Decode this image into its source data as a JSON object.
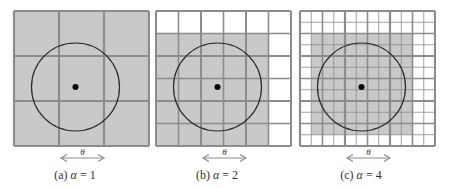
{
  "figure": {
    "colors": {
      "shaded": "#c9c9c9",
      "grid": "#8c8c8c",
      "circle": "#2a2a2a",
      "dot": "#000000",
      "arrow": "#8c8c8c",
      "text": "#333333"
    },
    "arrow_label": "θ",
    "panels": [
      {
        "id": "a",
        "caption_prefix": "(a) ",
        "caption_var": "α",
        "caption_suffix": " = 1",
        "alpha": 1,
        "grid_size": 3,
        "shaded": {
          "row_start": 0,
          "row_end": 2,
          "col_start": 0,
          "col_end": 2
        }
      },
      {
        "id": "b",
        "caption_prefix": "(b) ",
        "caption_var": "α",
        "caption_suffix": " = 2",
        "alpha": 2,
        "grid_size": 6,
        "shaded": {
          "row_start": 1,
          "row_end": 5,
          "col_start": 0,
          "col_end": 4
        }
      },
      {
        "id": "c",
        "caption_prefix": "(c) ",
        "caption_var": "α",
        "caption_suffix": " = 4",
        "alpha": 4,
        "grid_size": 12,
        "shaded": {
          "row_start": 2,
          "row_end": 10,
          "col_start": 1,
          "col_end": 9
        }
      }
    ]
  }
}
